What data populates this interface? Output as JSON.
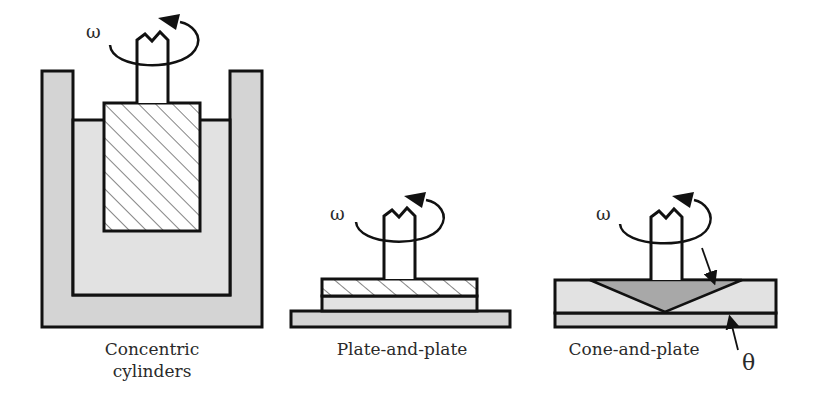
{
  "diagram": {
    "type": "rheometer-geometries",
    "symbols": {
      "angular_velocity": "ω",
      "cone_angle": "θ"
    },
    "colors": {
      "outline": "#111111",
      "fluid": "#dcdcdc",
      "solid": "#d0d0d0",
      "cone": "#a8a8a8",
      "hatch": "#333333"
    },
    "panels": [
      {
        "id": "concentric-cylinders",
        "caption_line1": "Concentric",
        "caption_line2": "cylinders",
        "omega": "ω"
      },
      {
        "id": "plate-and-plate",
        "caption_line1": "Plate-and-plate",
        "omega": "ω"
      },
      {
        "id": "cone-and-plate",
        "caption_line1": "Cone-and-plate",
        "omega": "ω",
        "angle_label": "θ"
      }
    ]
  }
}
